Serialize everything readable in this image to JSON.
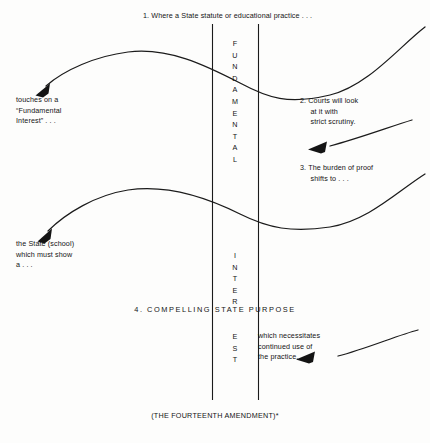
{
  "diagram": {
    "title_caption": "1. Where a State statute or educational practice . . .",
    "bottom_caption": "(THE FOURTEENTH AMENDMENT)*",
    "center_band": {
      "vertical_word_top": "FUNDAMENTAL",
      "vertical_word_middle": "INTER",
      "vertical_word_bottom": "EST",
      "full_vertical_phrase": "FUNDAMENTAL INTEREST"
    },
    "compelling_line": "4. COMPELLING STATE PURPOSE",
    "annotations": [
      {
        "id": "touches",
        "lines": "touches on a\n“Fundamental\nInterest” . . .",
        "side": "left"
      },
      {
        "id": "step2",
        "lines": "2. Courts will look\n     at it with\n     strict scrutiny.",
        "side": "right"
      },
      {
        "id": "step3",
        "lines": "3. The burden of proof\n     shifts to . . .",
        "side": "right"
      },
      {
        "id": "state",
        "lines": "the State (school)\nwhich must show\na . . .",
        "side": "left"
      },
      {
        "id": "necessitates",
        "lines": "which necessitates\ncontinued use of\nthe practice.",
        "side": "right"
      }
    ],
    "colors": {
      "ink": "#141414",
      "rule": "#1b1b1b",
      "paper": "#fdfdfc"
    }
  }
}
